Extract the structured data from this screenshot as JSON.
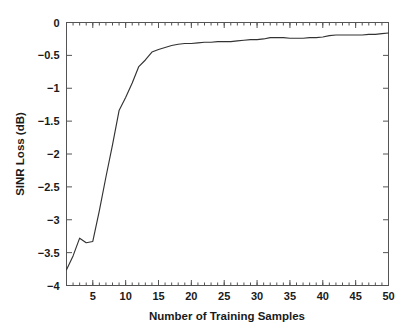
{
  "chart_data": {
    "type": "line",
    "title": "",
    "xlabel": "Number of Training Samples",
    "ylabel": "SINR Loss (dB)",
    "xlim": [
      1,
      50
    ],
    "ylim": [
      -4,
      0
    ],
    "grid": false,
    "legend": null,
    "legend_position": "none",
    "xticks": [
      5,
      10,
      15,
      20,
      25,
      30,
      35,
      40,
      45,
      50
    ],
    "xtick_labels": [
      "5",
      "10",
      "15",
      "20",
      "25",
      "30",
      "35",
      "40",
      "45",
      "50"
    ],
    "yticks": [
      0,
      -0.5,
      -1,
      -1.5,
      -2,
      -2.5,
      -3,
      -3.5,
      -4
    ],
    "ytick_labels": [
      "0",
      "-0.5",
      "-1",
      "-1.5",
      "-2",
      "-2.5",
      "-3",
      "-3.5",
      "-4"
    ],
    "x_minor_tick_interval": 1,
    "series": [
      {
        "name": "SINR Loss",
        "color": "#333333",
        "x": [
          1,
          2,
          3,
          4,
          5,
          6,
          7,
          8,
          9,
          10,
          11,
          12,
          13,
          14,
          15,
          16,
          17,
          18,
          19,
          20,
          21,
          22,
          23,
          24,
          25,
          26,
          27,
          28,
          29,
          30,
          31,
          32,
          33,
          34,
          35,
          36,
          37,
          38,
          39,
          40,
          41,
          42,
          43,
          44,
          45,
          46,
          47,
          48,
          49,
          50
        ],
        "y": [
          -3.76,
          -3.55,
          -3.28,
          -3.35,
          -3.33,
          -2.86,
          -2.35,
          -1.86,
          -1.34,
          -1.14,
          -0.92,
          -0.67,
          -0.57,
          -0.45,
          -0.41,
          -0.38,
          -0.35,
          -0.33,
          -0.32,
          -0.32,
          -0.31,
          -0.3,
          -0.3,
          -0.29,
          -0.29,
          -0.29,
          -0.28,
          -0.27,
          -0.26,
          -0.26,
          -0.25,
          -0.23,
          -0.23,
          -0.23,
          -0.24,
          -0.24,
          -0.24,
          -0.23,
          -0.23,
          -0.22,
          -0.2,
          -0.19,
          -0.19,
          -0.19,
          -0.19,
          -0.19,
          -0.18,
          -0.18,
          -0.17,
          -0.16
        ]
      }
    ],
    "axis_style": "box-all-sides-ticks-inward",
    "line_color": "#333333",
    "axis_color": "#545454",
    "background_color": "#ffffff"
  }
}
